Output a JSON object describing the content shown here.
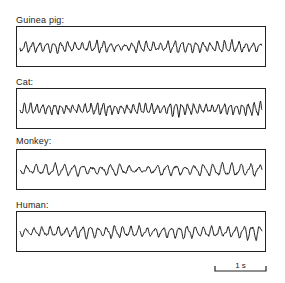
{
  "figure": {
    "panels": [
      {
        "label": "Guinea pig:",
        "amplitude": 6,
        "frequency": 34,
        "seed": 1
      },
      {
        "label": "Cat:",
        "amplitude": 8,
        "frequency": 40,
        "seed": 2
      },
      {
        "label": "Monkey:",
        "amplitude": 6,
        "frequency": 26,
        "seed": 3
      },
      {
        "label": "Human:",
        "amplitude": 7,
        "frequency": 30,
        "seed": 4
      }
    ],
    "scale_bar": {
      "label": "1 s"
    }
  }
}
